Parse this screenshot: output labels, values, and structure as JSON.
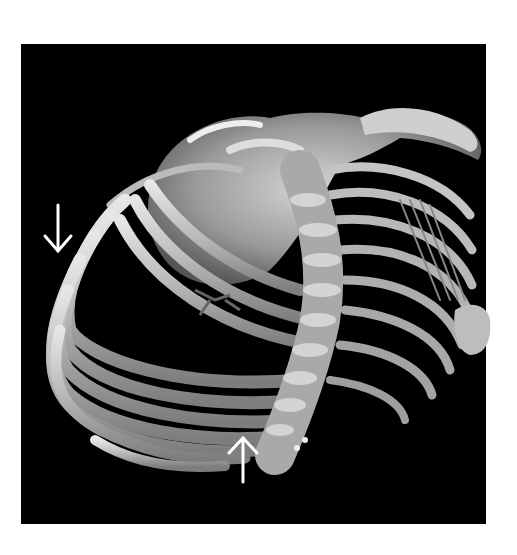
{
  "figure": {
    "background_color": "#000000",
    "margin_color": "#ffffff",
    "bone_color": "#c8c8c8",
    "arrows": [
      {
        "name": "arrow-down",
        "direction": "down",
        "x": 58,
        "y_top": 205,
        "y_tip": 252,
        "color": "#ffffff"
      },
      {
        "name": "arrow-up",
        "direction": "up",
        "x": 243,
        "y_tip": 438,
        "y_bottom": 483,
        "color": "#ffffff"
      }
    ]
  }
}
